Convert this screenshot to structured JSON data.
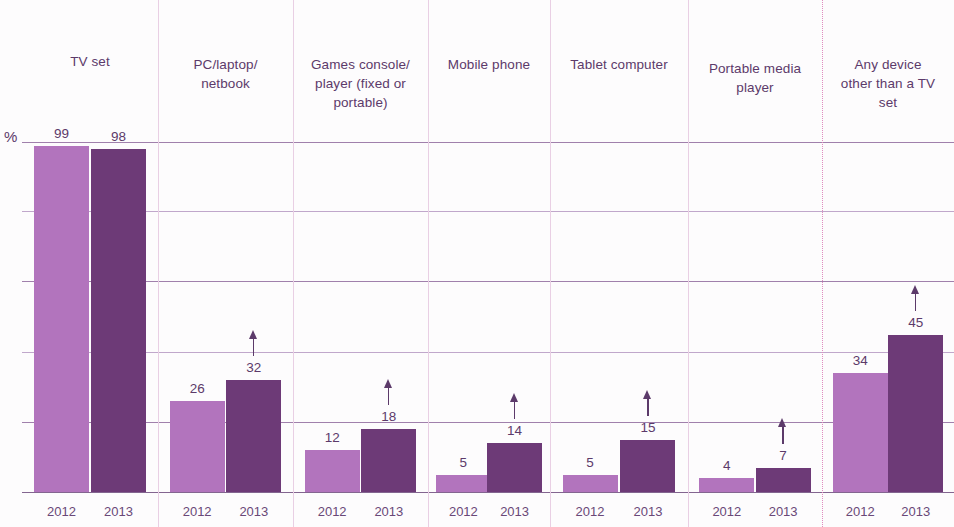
{
  "axis": {
    "unit_label": "%",
    "ylim": [
      0,
      140
    ],
    "gridline_values": [
      140,
      120,
      100,
      80,
      60,
      40,
      20,
      0
    ]
  },
  "legend_note": "",
  "chart_data": {
    "type": "bar",
    "title": "",
    "subtitle": "",
    "xlabel": "",
    "ylabel": "%",
    "ylim": [
      0,
      140
    ],
    "grid": true,
    "legend_position": "none",
    "categories": [
      "TV set",
      "PC/laptop/ netbook",
      "Games console/ player (fixed or portable)",
      "Mobile phone",
      "Tablet computer",
      "Portable media player",
      "Any device other than a TV set"
    ],
    "series": [
      {
        "name": "2012",
        "values": [
          99,
          26,
          12,
          5,
          5,
          4,
          34
        ]
      },
      {
        "name": "2013",
        "values": [
          98,
          32,
          18,
          14,
          15,
          7,
          45
        ]
      }
    ],
    "significance_arrows": {
      "2012": [
        false,
        false,
        false,
        false,
        false,
        false,
        false
      ],
      "2013": [
        false,
        true,
        true,
        true,
        true,
        true,
        true
      ]
    },
    "tick_labels": [
      "2012",
      "2013"
    ],
    "colors": {
      "2012": "#b274bd",
      "2013": "#6d3a77"
    }
  },
  "columns": [
    {
      "header": "TV set",
      "header_lines": [
        "TV set"
      ],
      "bars": [
        {
          "year": "2012",
          "value": 99,
          "label": "99",
          "arrow": false
        },
        {
          "year": "2013",
          "value": 98,
          "label": "98",
          "arrow": false
        }
      ]
    },
    {
      "header": "PC/laptop/ netbook",
      "header_lines": [
        "PC/laptop/",
        "netbook"
      ],
      "bars": [
        {
          "year": "2012",
          "value": 26,
          "label": "26",
          "arrow": false
        },
        {
          "year": "2013",
          "value": 32,
          "label": "32",
          "arrow": true
        }
      ]
    },
    {
      "header": "Games console/ player (fixed or portable)",
      "header_lines": [
        "Games console/",
        "player (fixed or",
        "portable)"
      ],
      "bars": [
        {
          "year": "2012",
          "value": 12,
          "label": "12",
          "arrow": false
        },
        {
          "year": "2013",
          "value": 18,
          "label": "18",
          "arrow": true
        }
      ]
    },
    {
      "header": "Mobile phone",
      "header_lines": [
        "Mobile phone"
      ],
      "bars": [
        {
          "year": "2012",
          "value": 5,
          "label": "5",
          "arrow": false
        },
        {
          "year": "2013",
          "value": 14,
          "label": "14",
          "arrow": true
        }
      ]
    },
    {
      "header": "Tablet computer",
      "header_lines": [
        "Tablet computer"
      ],
      "bars": [
        {
          "year": "2012",
          "value": 5,
          "label": "5",
          "arrow": false
        },
        {
          "year": "2013",
          "value": 15,
          "label": "15",
          "arrow": true
        }
      ]
    },
    {
      "header": "Portable media player",
      "header_lines": [
        "Portable media",
        "player"
      ],
      "bars": [
        {
          "year": "2012",
          "value": 4,
          "label": "4",
          "arrow": false
        },
        {
          "year": "2013",
          "value": 7,
          "label": "7",
          "arrow": true
        }
      ]
    },
    {
      "header": "Any device other than a TV set",
      "header_lines": [
        "Any device",
        "other than a TV",
        "set"
      ],
      "bars": [
        {
          "year": "2012",
          "value": 34,
          "label": "34",
          "arrow": false
        },
        {
          "year": "2013",
          "value": 45,
          "label": "45",
          "arrow": true
        }
      ]
    }
  ]
}
